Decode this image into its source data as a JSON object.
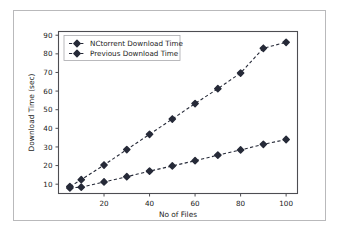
{
  "chart_data": {
    "type": "line",
    "title": "",
    "xlabel": "No of Files",
    "ylabel": "Download Time (sec)",
    "xlim": [
      0,
      105
    ],
    "ylim": [
      5,
      92
    ],
    "xticks": [
      20,
      40,
      60,
      80,
      100
    ],
    "yticks": [
      10,
      20,
      30,
      40,
      50,
      60,
      70,
      80,
      90
    ],
    "xtick_labels": [
      "20",
      "40",
      "60",
      "80",
      "100"
    ],
    "ytick_labels": [
      "10",
      "20",
      "30",
      "40",
      "50",
      "60",
      "70",
      "80",
      "90"
    ],
    "grid": false,
    "legend_position": "upper left",
    "x": [
      5,
      10,
      20,
      30,
      40,
      50,
      60,
      70,
      80,
      90,
      100
    ],
    "series": [
      {
        "name": "NCtorrent Download Time",
        "values": [
          8.0,
          8.4,
          11.2,
          14.0,
          17.0,
          19.8,
          22.6,
          25.6,
          28.4,
          31.4,
          34.0
        ],
        "color": "#262a38",
        "linestyle": "dashed",
        "marker": "diamond"
      },
      {
        "name": "Previous Download Time",
        "values": [
          8.7,
          12.4,
          20.3,
          28.6,
          36.8,
          45.0,
          53.3,
          61.3,
          69.7,
          83.0,
          86.2
        ],
        "color": "#262a38",
        "linestyle": "dashed",
        "marker": "diamond"
      }
    ]
  },
  "legend": {
    "entries": [
      {
        "label": "NCtorrent Download Time"
      },
      {
        "label": "Previous Download Time"
      }
    ]
  },
  "colors": {
    "series_primary": "#262a38",
    "axis": "#4d4d52",
    "border": "#b9b9bb",
    "background": "#ffffff"
  }
}
